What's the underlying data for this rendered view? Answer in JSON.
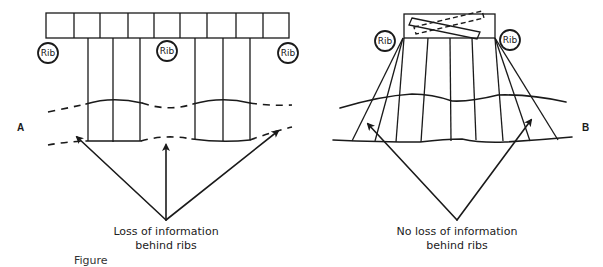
{
  "diagram": {
    "panel_a": {
      "label": "A",
      "rib_labels": [
        "Rib",
        "Rib",
        "Rib"
      ],
      "caption_line1": "Loss of information",
      "caption_line2": "behind ribs"
    },
    "panel_b": {
      "label": "B",
      "rib_labels": [
        "Rib",
        "Rib"
      ],
      "caption_line1": "No loss of information",
      "caption_line2": "behind ribs"
    },
    "figure_caption": "Figure"
  },
  "colors": {
    "ink": "#1a1a1a",
    "background": "#ffffff"
  }
}
